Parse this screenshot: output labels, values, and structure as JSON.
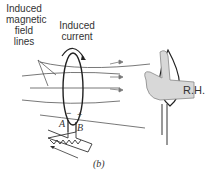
{
  "labels": {
    "induced_field_lines": [
      "Induced",
      "magnetic",
      "field",
      "lines"
    ],
    "induced_current": [
      "Induced",
      "current"
    ],
    "terminal_a": "A",
    "terminal_b": "B",
    "minus_sign": "−",
    "plus_sign": "+",
    "right_hand": "R.H.",
    "caption": "(b)"
  }
}
